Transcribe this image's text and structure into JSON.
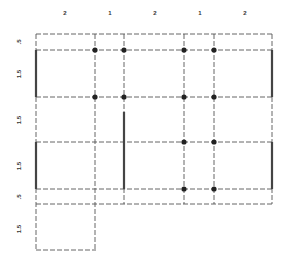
{
  "diagram": {
    "title": "",
    "column_widths": [
      "2",
      "1",
      "2",
      "1",
      "2"
    ],
    "row_heights": [
      ".5",
      "1.5",
      "1.5",
      "1.5",
      ".5",
      "1.5"
    ],
    "colors": {
      "line": "#555555",
      "thick": "#444444",
      "node": "#222222",
      "background": "#ffffff"
    },
    "grid": {
      "x": [
        36,
        94,
        124,
        184,
        214,
        272
      ],
      "y": [
        34,
        50,
        97,
        142,
        189,
        204,
        250
      ]
    },
    "nodes": [
      {
        "x": 94,
        "y": 50
      },
      {
        "x": 124,
        "y": 50
      },
      {
        "x": 184,
        "y": 50
      },
      {
        "x": 214,
        "y": 50
      },
      {
        "x": 94,
        "y": 97
      },
      {
        "x": 124,
        "y": 97
      },
      {
        "x": 184,
        "y": 97
      },
      {
        "x": 214,
        "y": 97
      },
      {
        "x": 184,
        "y": 142
      },
      {
        "x": 214,
        "y": 142
      },
      {
        "x": 184,
        "y": 189
      },
      {
        "x": 214,
        "y": 189
      }
    ],
    "thick_segments": [
      {
        "x": 36,
        "y1": 50,
        "y2": 97
      },
      {
        "x": 36,
        "y1": 142,
        "y2": 189
      },
      {
        "x": 272,
        "y1": 50,
        "y2": 97
      },
      {
        "x": 272,
        "y1": 142,
        "y2": 189
      },
      {
        "x": 124,
        "y1": 112,
        "y2": 189
      }
    ]
  }
}
